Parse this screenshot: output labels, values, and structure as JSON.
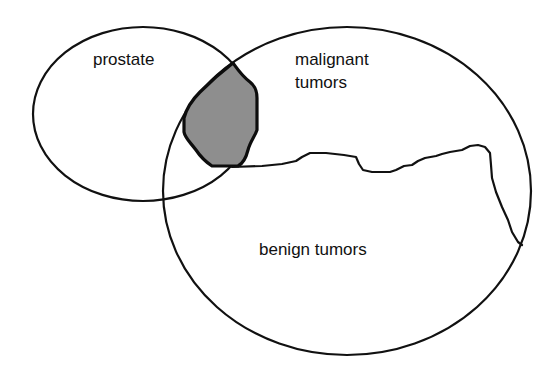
{
  "diagram": {
    "type": "venn",
    "sets": [
      {
        "id": "prostate",
        "label": "prostate"
      },
      {
        "id": "tumors",
        "label": "tumors",
        "subregions": [
          {
            "id": "malignant",
            "label_lines": [
              "malignant",
              "tumors"
            ]
          },
          {
            "id": "benign",
            "label": "benign tumors"
          }
        ]
      }
    ],
    "highlighted_region": "prostate ∩ malignant tumors",
    "colors": {
      "stroke": "#111111",
      "shade": "#8e8e8e",
      "background": "#ffffff"
    }
  },
  "labels": {
    "prostate": "prostate",
    "malignant_line1": "malignant",
    "malignant_line2": "tumors",
    "benign": "benign tumors"
  }
}
